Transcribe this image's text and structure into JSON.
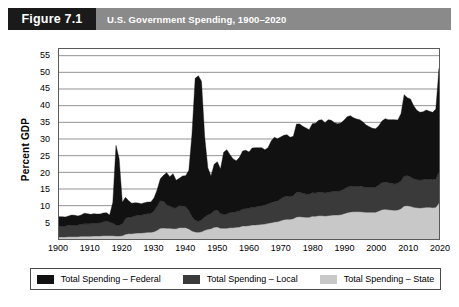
{
  "figure": {
    "tag": "Figure 7.1",
    "title": "U.S. Government Spending, 1900–2020"
  },
  "legend": {
    "items": [
      {
        "label": "Total Spending – Federal",
        "color": "#111111"
      },
      {
        "label": "Total Spending – Local",
        "color": "#3a3a3a"
      },
      {
        "label": "Total Spending – State",
        "color": "#c8c8c8"
      }
    ]
  },
  "colors": {
    "header_band": "#8a8a8a",
    "figure_tag": "#1a1a1a",
    "federal": "#111111",
    "local": "#3a3a3a",
    "state": "#c8c8c8",
    "grid": "#777777",
    "frame": "#5a5a5a",
    "plot_background": "#ffffff"
  },
  "chart_data": {
    "type": "area",
    "stacked": true,
    "title": "U.S. Government Spending, 1900–2020",
    "xlabel": "",
    "ylabel": "Percent GDP",
    "xlim": [
      1900,
      2020
    ],
    "ylim": [
      0,
      57
    ],
    "yticks": [
      5,
      10,
      15,
      20,
      25,
      30,
      35,
      40,
      45,
      50,
      55
    ],
    "xticks": [
      1900,
      1910,
      1920,
      1930,
      1940,
      1950,
      1960,
      1970,
      1980,
      1990,
      2000,
      2010,
      2020
    ],
    "grid": "horizontal",
    "legend_position": "below",
    "stack_order_bottom_to_top": [
      "Total Spending – State",
      "Total Spending – Local",
      "Total Spending – Federal"
    ],
    "x": [
      1900,
      1901,
      1902,
      1903,
      1904,
      1905,
      1906,
      1907,
      1908,
      1909,
      1910,
      1911,
      1912,
      1913,
      1914,
      1915,
      1916,
      1917,
      1918,
      1919,
      1920,
      1921,
      1922,
      1923,
      1924,
      1925,
      1926,
      1927,
      1928,
      1929,
      1930,
      1931,
      1932,
      1933,
      1934,
      1935,
      1936,
      1937,
      1938,
      1939,
      1940,
      1941,
      1942,
      1943,
      1944,
      1945,
      1946,
      1947,
      1948,
      1949,
      1950,
      1951,
      1952,
      1953,
      1954,
      1955,
      1956,
      1957,
      1958,
      1959,
      1960,
      1961,
      1962,
      1963,
      1964,
      1965,
      1966,
      1967,
      1968,
      1969,
      1970,
      1971,
      1972,
      1973,
      1974,
      1975,
      1976,
      1977,
      1978,
      1979,
      1980,
      1981,
      1982,
      1983,
      1984,
      1985,
      1986,
      1987,
      1988,
      1989,
      1990,
      1991,
      1992,
      1993,
      1994,
      1995,
      1996,
      1997,
      1998,
      1999,
      2000,
      2001,
      2002,
      2003,
      2004,
      2005,
      2006,
      2007,
      2008,
      2009,
      2010,
      2011,
      2012,
      2013,
      2014,
      2015,
      2016,
      2017,
      2018,
      2019,
      2020
    ],
    "series": [
      {
        "name": "Total Spending – State",
        "color": "#c8c8c8",
        "values": [
          0.6,
          0.6,
          0.6,
          0.7,
          0.7,
          0.7,
          0.7,
          0.8,
          0.8,
          0.8,
          0.8,
          0.9,
          0.9,
          0.9,
          1.0,
          1.0,
          1.0,
          1.0,
          0.9,
          0.9,
          1.0,
          1.4,
          1.6,
          1.6,
          1.7,
          1.8,
          1.8,
          1.9,
          2.0,
          2.0,
          2.2,
          2.6,
          3.2,
          3.3,
          3.2,
          3.2,
          3.1,
          3.1,
          3.4,
          3.4,
          3.4,
          3.0,
          2.4,
          2.1,
          2.0,
          2.2,
          2.6,
          2.9,
          3.1,
          3.5,
          3.6,
          3.2,
          3.2,
          3.2,
          3.4,
          3.4,
          3.5,
          3.6,
          3.9,
          3.9,
          4.0,
          4.2,
          4.2,
          4.3,
          4.4,
          4.5,
          4.7,
          4.9,
          5.1,
          5.2,
          5.5,
          5.8,
          5.9,
          5.9,
          6.1,
          6.6,
          6.7,
          6.6,
          6.5,
          6.5,
          6.8,
          6.8,
          7.0,
          7.0,
          6.9,
          7.0,
          7.1,
          7.2,
          7.2,
          7.3,
          7.6,
          7.9,
          8.1,
          8.2,
          8.2,
          8.2,
          8.1,
          8.0,
          8.0,
          8.0,
          8.0,
          8.4,
          8.8,
          8.9,
          8.8,
          8.7,
          8.6,
          8.7,
          9.1,
          9.9,
          10.0,
          9.8,
          9.5,
          9.4,
          9.3,
          9.4,
          9.5,
          9.5,
          9.4,
          9.5,
          10.8
        ]
      },
      {
        "name": "Total Spending – Local",
        "color": "#3a3a3a",
        "values": [
          3.2,
          3.3,
          3.3,
          3.4,
          3.5,
          3.5,
          3.5,
          3.6,
          3.8,
          3.8,
          3.8,
          3.9,
          3.9,
          4.0,
          4.2,
          4.3,
          4.1,
          3.8,
          3.2,
          3.2,
          3.5,
          4.7,
          5.0,
          5.0,
          5.2,
          5.3,
          5.3,
          5.5,
          5.6,
          5.6,
          6.2,
          7.2,
          8.3,
          8.0,
          7.0,
          6.7,
          6.3,
          6.2,
          6.6,
          6.5,
          6.3,
          5.5,
          4.3,
          3.5,
          3.3,
          3.5,
          4.0,
          4.3,
          4.5,
          5.0,
          5.0,
          4.4,
          4.3,
          4.3,
          4.5,
          4.6,
          4.7,
          4.8,
          5.1,
          5.2,
          5.2,
          5.4,
          5.4,
          5.5,
          5.6,
          5.7,
          5.8,
          6.0,
          6.1,
          6.2,
          6.5,
          6.8,
          6.9,
          6.8,
          6.9,
          7.4,
          7.3,
          7.1,
          7.0,
          6.9,
          7.1,
          7.0,
          7.0,
          7.0,
          6.9,
          7.0,
          7.1,
          7.1,
          7.1,
          7.2,
          7.4,
          7.6,
          7.7,
          7.7,
          7.7,
          7.7,
          7.6,
          7.5,
          7.5,
          7.5,
          7.5,
          7.8,
          8.1,
          8.2,
          8.1,
          8.0,
          7.9,
          8.0,
          8.3,
          9.0,
          9.0,
          8.8,
          8.6,
          8.4,
          8.4,
          8.4,
          8.5,
          8.5,
          8.4,
          8.5,
          9.4
        ]
      },
      {
        "name": "Total Spending – Federal",
        "color": "#111111",
        "values": [
          2.9,
          2.8,
          2.7,
          2.8,
          3.0,
          2.9,
          2.7,
          2.8,
          3.1,
          3.0,
          2.8,
          2.8,
          2.7,
          2.6,
          2.6,
          2.6,
          2.1,
          6.2,
          24.0,
          20.0,
          6.5,
          6.4,
          4.9,
          4.1,
          4.0,
          3.7,
          3.5,
          3.5,
          3.5,
          3.5,
          3.9,
          5.0,
          6.6,
          7.8,
          9.7,
          8.8,
          10.2,
          8.3,
          8.2,
          9.0,
          9.3,
          12.1,
          24.8,
          42.6,
          43.7,
          41.6,
          24.2,
          14.2,
          11.3,
          13.9,
          14.6,
          13.4,
          18.5,
          19.3,
          17.4,
          16.0,
          15.3,
          16.1,
          17.4,
          17.5,
          16.9,
          17.7,
          17.8,
          17.6,
          17.4,
          16.6,
          16.9,
          18.5,
          19.3,
          18.7,
          18.6,
          18.5,
          18.5,
          17.8,
          17.8,
          20.5,
          20.5,
          20.1,
          19.8,
          19.4,
          20.7,
          20.9,
          21.6,
          21.8,
          21.1,
          21.8,
          21.4,
          20.6,
          20.3,
          20.3,
          20.6,
          21.2,
          21.2,
          20.5,
          20.1,
          19.9,
          19.4,
          18.7,
          18.2,
          17.7,
          17.6,
          17.8,
          18.5,
          19.0,
          18.9,
          19.1,
          19.3,
          19.0,
          20.2,
          24.4,
          23.4,
          23.4,
          21.9,
          20.8,
          20.3,
          20.4,
          20.7,
          20.3,
          20.2,
          21.0,
          31.0
        ]
      }
    ],
    "notable_points": [
      {
        "year": 1918,
        "label": "World War I peak",
        "total_percent_gdp": 28.1
      },
      {
        "year": 1944,
        "label": "World War II peak",
        "total_percent_gdp": 49.0
      },
      {
        "year": 1945,
        "label": "World War II peak total",
        "total_percent_gdp": 47.3
      },
      {
        "year": 2009,
        "label": "Great Recession peak",
        "total_percent_gdp": 43.3
      },
      {
        "year": 2020,
        "label": "COVID-19 peak",
        "total_percent_gdp": 51.2
      }
    ]
  }
}
